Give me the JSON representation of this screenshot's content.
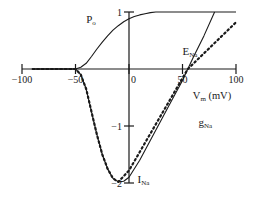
{
  "chart_data": {
    "type": "line",
    "title": "",
    "xlabel": "Vm (mV)",
    "ylabel": "",
    "xlim": [
      -100,
      100
    ],
    "ylim": [
      -2,
      1
    ],
    "grid": false,
    "x_ticks": [
      -100,
      -50,
      0,
      50,
      100
    ],
    "x_tick_labels": [
      "−100",
      "−50",
      "0",
      "50",
      "100"
    ],
    "y_ticks": [
      1,
      -1,
      -2
    ],
    "y_tick_labels": [
      "1",
      "−1",
      "−2"
    ],
    "series": [
      {
        "name": "Po",
        "style": "solid",
        "x": [
          -90,
          -60,
          -50,
          -45,
          -40,
          -35,
          -30,
          -25,
          -20,
          -15,
          -10,
          -5,
          0,
          5,
          10,
          15,
          20,
          25,
          30,
          50,
          100
        ],
        "values": [
          0,
          0,
          0,
          0.03,
          0.1,
          0.22,
          0.35,
          0.47,
          0.58,
          0.68,
          0.76,
          0.83,
          0.88,
          0.92,
          0.95,
          0.97,
          0.99,
          1.0,
          1.0,
          1.0,
          1.0
        ]
      },
      {
        "name": "INa",
        "style": "solid",
        "x": [
          -90,
          -60,
          -50,
          -45,
          -40,
          -35,
          -30,
          -25,
          -20,
          -15,
          -10,
          -5,
          0,
          10,
          20,
          30,
          40,
          50,
          55,
          60,
          70,
          80
        ],
        "values": [
          0,
          0,
          0,
          -0.1,
          -0.35,
          -0.75,
          -1.15,
          -1.5,
          -1.75,
          -1.92,
          -1.98,
          -1.97,
          -1.9,
          -1.6,
          -1.25,
          -0.9,
          -0.55,
          -0.2,
          0,
          0.2,
          0.58,
          1.0
        ]
      },
      {
        "name": "gNa",
        "style": "dotted",
        "x": [
          -90,
          -60,
          -50,
          -45,
          -40,
          -35,
          -30,
          -25,
          -20,
          -15,
          -10,
          0,
          55,
          100
        ],
        "values": [
          0,
          0,
          0,
          -0.1,
          -0.35,
          -0.75,
          -1.15,
          -1.5,
          -1.75,
          -1.92,
          -1.98,
          -1.78,
          0,
          0.82
        ]
      }
    ],
    "annotations": [
      {
        "text": "P",
        "sub": "o",
        "x": -40,
        "y": 0.8
      },
      {
        "text": "E",
        "sub": "Na",
        "x": 50,
        "y": 0.25
      },
      {
        "text": "g",
        "sub": "Na",
        "x": 65,
        "y": -1.0
      },
      {
        "text": "I",
        "sub": "Na",
        "x": 8,
        "y": -2.0
      }
    ]
  }
}
